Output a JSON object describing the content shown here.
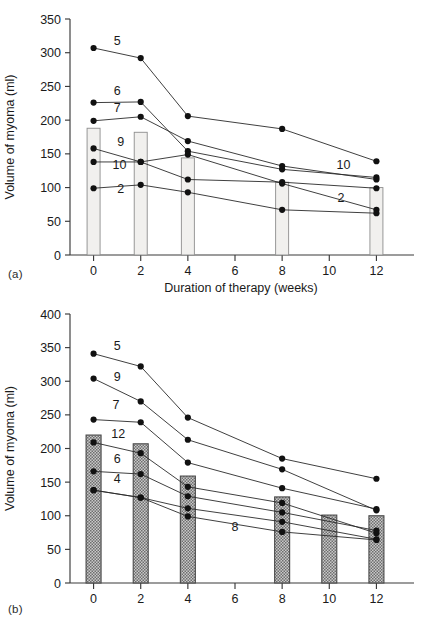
{
  "figure": {
    "panel_a_tag": "(a)",
    "panel_b_tag": "(b)"
  },
  "chart_data": [
    {
      "id": "panel-a",
      "type": "line",
      "title": "",
      "xlabel": "Duration of therapy (weeks)",
      "ylabel": "Volume of myoma (ml)",
      "xlim": [
        -1,
        13
      ],
      "ylim": [
        0,
        350
      ],
      "yticks": [
        0,
        50,
        100,
        150,
        200,
        250,
        300,
        350
      ],
      "xticks": [
        0,
        2,
        4,
        6,
        8,
        10,
        12
      ],
      "grid": false,
      "legend": "inline-series-labels",
      "x": [
        0,
        2,
        4,
        8,
        12
      ],
      "bars": {
        "name": "Mean volume",
        "x": [
          0,
          2,
          4,
          8,
          12
        ],
        "values": [
          188,
          182,
          144,
          108,
          100
        ],
        "style": "light-gray-outlined"
      },
      "series": [
        {
          "name": "5",
          "label": "5",
          "x": [
            0,
            2,
            4,
            8,
            12
          ],
          "values": [
            307,
            292,
            206,
            187,
            139
          ]
        },
        {
          "name": "6",
          "label": "6",
          "x": [
            0,
            2,
            4,
            8,
            12
          ],
          "values": [
            226,
            227,
            154,
            127,
            115
          ]
        },
        {
          "name": "7",
          "label": "7",
          "x": [
            0,
            2,
            4,
            8,
            12
          ],
          "values": [
            199,
            205,
            169,
            132,
            112
          ]
        },
        {
          "name": "9",
          "label": "9",
          "x": [
            0,
            2,
            4,
            8,
            12
          ],
          "values": [
            158,
            138,
            149,
            106,
            67
          ]
        },
        {
          "name": "10",
          "label": "10",
          "x": [
            0,
            2,
            4,
            8,
            12
          ],
          "values": [
            138,
            138,
            112,
            108,
            99
          ]
        },
        {
          "name": "2",
          "label": "2",
          "x": [
            0,
            2,
            4,
            8,
            12
          ],
          "values": [
            99,
            104,
            93,
            67,
            62
          ]
        }
      ],
      "annotations": [
        {
          "text": "5",
          "x": 1.0,
          "y": 312
        },
        {
          "text": "6",
          "x": 1.0,
          "y": 238
        },
        {
          "text": "7",
          "x": 1.0,
          "y": 212
        },
        {
          "text": "9",
          "x": 1.15,
          "y": 161
        },
        {
          "text": "10",
          "x": 1.1,
          "y": 128
        },
        {
          "text": "2",
          "x": 1.15,
          "y": 92
        },
        {
          "text": "10",
          "x": 10.6,
          "y": 128
        },
        {
          "text": "2",
          "x": 10.5,
          "y": 78
        }
      ]
    },
    {
      "id": "panel-b",
      "type": "line",
      "title": "",
      "xlabel": "Duration of therapy (weeks)",
      "ylabel": "Volume of myoma (ml)",
      "xlim": [
        -1,
        13
      ],
      "ylim": [
        0,
        400
      ],
      "yticks": [
        0,
        50,
        100,
        150,
        200,
        250,
        300,
        350,
        400
      ],
      "xticks": [
        0,
        2,
        4,
        6,
        8,
        10,
        12
      ],
      "grid": false,
      "legend": "inline-series-labels",
      "x": [
        0,
        2,
        4,
        8,
        10,
        12
      ],
      "bars": {
        "name": "Mean volume",
        "x": [
          0,
          2,
          4,
          8,
          10,
          12
        ],
        "values": [
          220,
          207,
          159,
          128,
          101,
          100
        ],
        "style": "stippled-gray"
      },
      "series": [
        {
          "name": "5",
          "label": "5",
          "x": [
            0,
            2,
            4,
            8,
            12
          ],
          "values": [
            341,
            322,
            246,
            185,
            155
          ]
        },
        {
          "name": "9",
          "label": "9",
          "x": [
            0,
            2,
            4,
            8,
            12
          ],
          "values": [
            304,
            270,
            213,
            169,
            108
          ]
        },
        {
          "name": "7",
          "label": "7",
          "x": [
            0,
            2,
            4,
            8,
            12
          ],
          "values": [
            243,
            239,
            179,
            141,
            110
          ]
        },
        {
          "name": "12",
          "label": "12",
          "x": [
            0,
            2,
            4,
            8,
            12
          ],
          "values": [
            209,
            193,
            143,
            119,
            74
          ]
        },
        {
          "name": "6",
          "label": "6",
          "x": [
            0,
            2,
            4,
            8,
            12
          ],
          "values": [
            166,
            162,
            129,
            105,
            78
          ]
        },
        {
          "name": "4",
          "label": "4",
          "x": [
            0,
            2,
            4,
            8,
            12
          ],
          "values": [
            138,
            127,
            111,
            91,
            65
          ]
        },
        {
          "name": "8",
          "label": "8",
          "x": [
            0,
            2,
            4,
            8,
            12
          ],
          "values": [
            138,
            127,
            99,
            76,
            64
          ]
        }
      ],
      "annotations": [
        {
          "text": "5",
          "x": 1.0,
          "y": 347
        },
        {
          "text": "9",
          "x": 1.0,
          "y": 300
        },
        {
          "text": "7",
          "x": 0.95,
          "y": 258
        },
        {
          "text": "12",
          "x": 1.05,
          "y": 215
        },
        {
          "text": "6",
          "x": 1.0,
          "y": 178
        },
        {
          "text": "4",
          "x": 1.0,
          "y": 148
        },
        {
          "text": "8",
          "x": 6.0,
          "y": 78
        }
      ]
    }
  ]
}
